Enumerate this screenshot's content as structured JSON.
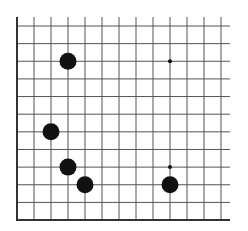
{
  "diagram": {
    "type": "go-board-corner",
    "corner": "bottom-left",
    "columns": 13,
    "rows": 12,
    "grid": {
      "origin_x": 17,
      "origin_y": 26,
      "spacing_x": 17.0,
      "spacing_y": 17.64,
      "extend_right": 9,
      "extend_top": 9
    },
    "colors": {
      "background": "#ffffff",
      "line": "#555555",
      "edge": "#333333",
      "stone_black": "#111111",
      "hoshi": "#111111"
    },
    "stones": [
      {
        "color": "black",
        "col": 3,
        "row": 2
      },
      {
        "color": "black",
        "col": 2,
        "row": 6
      },
      {
        "color": "black",
        "col": 3,
        "row": 8
      },
      {
        "color": "black",
        "col": 4,
        "row": 9
      },
      {
        "color": "black",
        "col": 9,
        "row": 9
      }
    ],
    "hoshi": [
      {
        "col": 9,
        "row": 2
      },
      {
        "col": 9,
        "row": 8
      }
    ],
    "stone_radius": 8.5,
    "hoshi_radius": 2
  }
}
